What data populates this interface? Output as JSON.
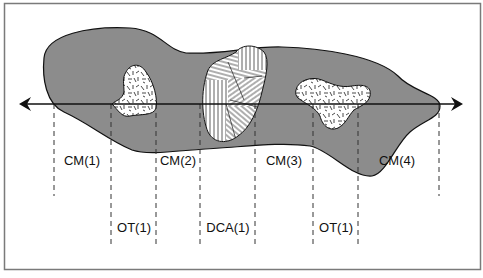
{
  "diagram": {
    "colors": {
      "frame": "#7a7a7a",
      "mass_fill": "#8c8c8c",
      "outline": "#111111",
      "inclusion_fill": "#ffffff",
      "dash": "#333333"
    },
    "transect": {
      "direction": "bidirectional-arrow"
    },
    "segments": [
      {
        "label": "CM(1)",
        "row": "upper"
      },
      {
        "label": "OT(1)",
        "row": "lower"
      },
      {
        "label": "CM(2)",
        "row": "upper"
      },
      {
        "label": "DCA(1)",
        "row": "lower"
      },
      {
        "label": "CM(3)",
        "row": "upper"
      },
      {
        "label": "OT(1)",
        "row": "lower"
      },
      {
        "label": "CM(4)",
        "row": "upper"
      }
    ],
    "inclusions": [
      {
        "name": "OT-inclusion-left",
        "texture": "random-dashes"
      },
      {
        "name": "DCA-inclusion",
        "texture": "parallel-line-domains"
      },
      {
        "name": "OT-inclusion-right",
        "texture": "random-dashes"
      }
    ]
  }
}
